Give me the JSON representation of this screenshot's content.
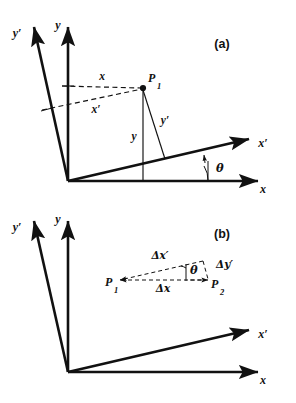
{
  "figure": {
    "background_color": "#ffffff",
    "ink_color": "#111111",
    "width": 296,
    "height": 403
  },
  "panels": [
    {
      "id": "panel-a",
      "label": "(a)",
      "description": "Point P1 shown in unprimed (x, y) and primed (x', y') rotated axes",
      "axes": [
        {
          "name": "y-axis",
          "label": "y"
        },
        {
          "name": "y-prime-axis",
          "label": "y′"
        },
        {
          "name": "x-axis",
          "label": "x"
        },
        {
          "name": "x-prime-axis",
          "label": "x′"
        }
      ],
      "angle_label": "θ",
      "points": [
        {
          "name": "P1",
          "base": "P",
          "subscript": "1"
        }
      ],
      "measures": [
        {
          "name": "x-projection",
          "label": "x"
        },
        {
          "name": "x-prime-projection",
          "label": "x′"
        },
        {
          "name": "y-projection",
          "label": "y"
        },
        {
          "name": "y-prime-projection",
          "label": "y′"
        }
      ]
    },
    {
      "id": "panel-b",
      "label": "(b)",
      "description": "Displacement between P1 and P2 decomposed in both frames",
      "axes": [
        {
          "name": "y-axis",
          "label": "y"
        },
        {
          "name": "y-prime-axis",
          "label": "y′"
        },
        {
          "name": "x-axis",
          "label": "x"
        },
        {
          "name": "x-prime-axis",
          "label": "x′"
        }
      ],
      "angle_label": "θ",
      "points": [
        {
          "name": "P1",
          "base": "P",
          "subscript": "1"
        },
        {
          "name": "P2",
          "base": "P",
          "subscript": "2"
        }
      ],
      "measures": [
        {
          "name": "delta-x",
          "label": "Δx"
        },
        {
          "name": "delta-x-prime",
          "label": "Δx′"
        },
        {
          "name": "delta-y-prime",
          "label": "Δy′"
        }
      ]
    }
  ]
}
